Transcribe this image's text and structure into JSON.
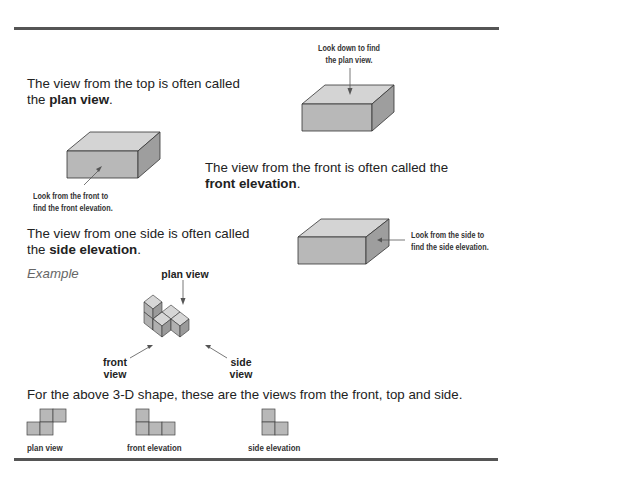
{
  "plan": {
    "text_line1": "The view from the top is often called",
    "text_prefix": "the ",
    "term": "plan view",
    "text_suffix": ".",
    "caption_line1": "Look down to find",
    "caption_line2": "the plan view."
  },
  "front": {
    "text_line1": "The view from the front is often called the",
    "term": "front elevation",
    "text_suffix": ".",
    "caption_line1": "Look from the front to",
    "caption_line2": "find the front elevation."
  },
  "side": {
    "text_line1": "The view from one side is often called",
    "text_prefix": "the ",
    "term": "side elevation",
    "text_suffix": ".",
    "caption_line1": "Look from the side to",
    "caption_line2": "find the side elevation."
  },
  "example": {
    "label": "Example",
    "plan_label": "plan view",
    "front_label_line1": "front",
    "front_label_line2": "view",
    "side_label_line1": "side",
    "side_label_line2": "view"
  },
  "summary": {
    "text": "For the above 3-D shape, these are the views from the front, top and side.",
    "views": [
      {
        "label": "plan view"
      },
      {
        "label": "front elevation"
      },
      {
        "label": "side elevation"
      }
    ]
  },
  "colors": {
    "rule": "#555555",
    "face_front": "#b8b8b8",
    "face_top": "#d4d4d4",
    "face_side": "#9e9e9e",
    "stroke": "#333333"
  }
}
